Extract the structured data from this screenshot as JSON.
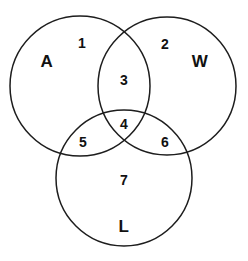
{
  "figure": {
    "type": "venn-diagram-3-set",
    "background_color": "#ffffff",
    "stroke_color": "#1d1d1d",
    "text_color": "#111111",
    "width": 248,
    "height": 261
  },
  "sets": [
    {
      "key": "A",
      "label": "A",
      "label_x": 47,
      "label_y": 61,
      "cx": 80,
      "cy": 86,
      "r": 70
    },
    {
      "key": "W",
      "label": "W",
      "label_x": 200,
      "label_y": 61,
      "cx": 167,
      "cy": 86,
      "r": 69
    },
    {
      "key": "L",
      "label": "L",
      "label_x": 124,
      "label_y": 226,
      "cx": 124,
      "cy": 178,
      "r": 68
    }
  ],
  "regions": [
    {
      "id": "region-1",
      "label": "1",
      "x": 82,
      "y": 43,
      "belongs_to": "A only"
    },
    {
      "id": "region-2",
      "label": "2",
      "x": 165,
      "y": 44,
      "belongs_to": "W only"
    },
    {
      "id": "region-3",
      "label": "3",
      "x": 124,
      "y": 80,
      "belongs_to": "A and W"
    },
    {
      "id": "region-4",
      "label": "4",
      "x": 124,
      "y": 124,
      "belongs_to": "A and W and L"
    },
    {
      "id": "region-5",
      "label": "5",
      "x": 83,
      "y": 142,
      "belongs_to": "A and L"
    },
    {
      "id": "region-6",
      "label": "6",
      "x": 165,
      "y": 142,
      "belongs_to": "W and L"
    },
    {
      "id": "region-7",
      "label": "7",
      "x": 124,
      "y": 180,
      "belongs_to": "L only"
    }
  ]
}
